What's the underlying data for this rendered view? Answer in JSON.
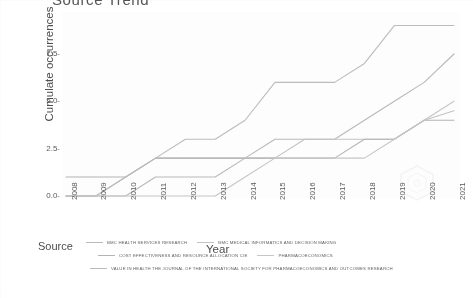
{
  "chart_data": {
    "type": "line",
    "title": "Source Trend",
    "xlabel": "Year",
    "ylabel": "Cumulate occurrences",
    "legend_title": "Source",
    "legend_position": "bottom",
    "grid": false,
    "x": [
      2008,
      2009,
      2010,
      2011,
      2012,
      2013,
      2014,
      2015,
      2016,
      2017,
      2018,
      2019,
      2020,
      2021
    ],
    "xtick_labels": [
      "2008",
      "2009",
      "2010",
      "2011",
      "2012",
      "2013",
      "2014",
      "2015",
      "2016",
      "2017",
      "2018",
      "2019",
      "2020",
      "2021"
    ],
    "ytick_labels": [
      "0.0",
      "2.5",
      "5.0",
      "7.5"
    ],
    "ytick_values": [
      0.0,
      2.5,
      5.0,
      7.5
    ],
    "ylim": [
      0,
      9.4
    ],
    "xlim": [
      2008,
      2021
    ],
    "series": [
      {
        "name": "BMC HEALTH SERVICES RESEARCH",
        "color": "#b9b9b9",
        "values": [
          0,
          0,
          0,
          1,
          1,
          1,
          2,
          3,
          3,
          3,
          4,
          5,
          6,
          7.5
        ]
      },
      {
        "name": "BMC MEDICAL INFORMATICS AND DECISION MAKING",
        "color": "#c2c2c2",
        "values": [
          0,
          0,
          1,
          2,
          2,
          2,
          2,
          2,
          3,
          3,
          3,
          3,
          4,
          4.5
        ]
      },
      {
        "name": "COST EFFECTIVENESS AND RESOURCE ALLOCATION  C/E",
        "color": "#b4b4b4",
        "values": [
          1,
          1,
          1,
          2,
          2,
          2,
          2,
          2,
          2,
          2,
          3,
          3,
          4,
          4
        ]
      },
      {
        "name": "PHARMACOECONOMICS",
        "color": "#c6c6c6",
        "values": [
          0,
          0,
          0,
          0,
          0,
          0,
          1,
          2,
          2,
          2,
          2,
          3,
          4,
          5
        ]
      },
      {
        "name": "VALUE IN HEALTH  THE JOURNAL OF THE INTERNATIONAL SOCIETY FOR PHARMACOECONOMICS AND OUTCOMES RESEARCH",
        "color": "#bcbcbc",
        "values": [
          0,
          0,
          1,
          2,
          3,
          3,
          4,
          6,
          6,
          6,
          7,
          9,
          9,
          9
        ]
      }
    ]
  },
  "legend": {
    "title": "Source",
    "row1": [
      "BMC HEALTH SERVICES RESEARCH",
      "BMC MEDICAL INFORMATICS AND DECISION MAKING"
    ],
    "row2": [
      "COST EFFECTIVENESS AND RESOURCE ALLOCATION  C/E",
      "PHARMACOECONOMICS"
    ],
    "row3": [
      "VALUE IN HEALTH  THE JOURNAL OF THE INTERNATIONAL SOCIETY FOR PHARMACOECONOMICS AND OUTCOMES RESEARCH"
    ]
  },
  "watermark": {
    "label": "hexagon-watermark"
  }
}
